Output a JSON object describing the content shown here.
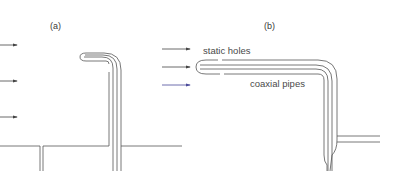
{
  "figure": {
    "panel_a": {
      "label": "(a)"
    },
    "panel_b": {
      "label": "(b)",
      "annotations": {
        "static_holes": "static holes",
        "coaxial_pipes": "coaxial pipes"
      }
    }
  },
  "colors": {
    "line": "#555555",
    "arrow": "#444444",
    "arrow_accent": "#4a4a9a",
    "text": "#3a3a3a"
  },
  "icons": {
    "flow_arrow": "right-arrow-icon"
  }
}
